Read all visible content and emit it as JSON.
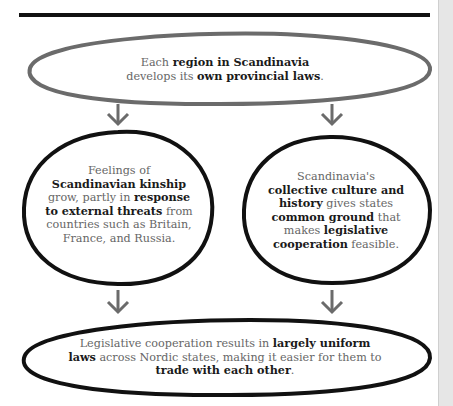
{
  "top_node": {
    "parts": [
      "Each ",
      "region in Scandinavia",
      " develops its ",
      "own provincial laws",
      "."
    ]
  },
  "left_node": {
    "parts": [
      "Feelings of ",
      "Scandinavian kinship",
      " grow, partly in ",
      "response to external threats",
      " from countries such as Britain, France, and Russia."
    ]
  },
  "right_node": {
    "parts": [
      "Scandinavia's ",
      "collective culture and history",
      " gives states ",
      "common ground",
      " that makes ",
      "legislative cooperation",
      " feasible."
    ]
  },
  "bottom_node": {
    "parts": [
      "Legislative cooperation results in ",
      "largely uniform laws",
      " across Nordic states, making it easier for them to ",
      "trade with each other",
      "."
    ]
  },
  "colors": {
    "top_outline": "#6b6b6b",
    "outline": "#111111",
    "arrow": "#6b6b6b",
    "text": "#666666",
    "bold_text": "#1a1a1a"
  }
}
